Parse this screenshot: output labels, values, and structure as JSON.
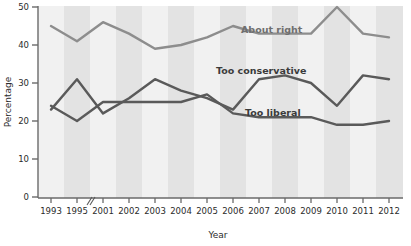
{
  "chart_data": {
    "type": "line",
    "title": "",
    "xlabel": "Year",
    "ylabel": "Percentage",
    "ylim": [
      0,
      50
    ],
    "yticks": [
      0,
      10,
      20,
      30,
      40,
      50
    ],
    "grid": false,
    "axis_break": "//",
    "axis_break_note": "break in x-axis between 1995 and 2001",
    "legend_position": "inline-labels",
    "categories": [
      "1993",
      "1995",
      "2001",
      "2002",
      "2003",
      "2004",
      "2005",
      "2006",
      "2007",
      "2008",
      "2009",
      "2010",
      "2011",
      "2012"
    ],
    "series": [
      {
        "name": "About right",
        "color": "#8d8d8d",
        "values": [
          45,
          41,
          46,
          43,
          39,
          40,
          42,
          45,
          43,
          43,
          43,
          50,
          43,
          42
        ]
      },
      {
        "name": "Too conservative",
        "color": "#5a5a5a",
        "values": [
          24,
          20,
          25,
          25,
          25,
          25,
          27,
          22,
          21,
          21,
          21,
          19,
          19,
          20
        ]
      },
      {
        "name": "Too liberal",
        "color": "#5a5a5a",
        "values": [
          23,
          31,
          22,
          26,
          31,
          28,
          26,
          23,
          31,
          32,
          30,
          24,
          32,
          31
        ]
      }
    ]
  },
  "axes": {
    "y_title": "Percentage",
    "x_title": "Year",
    "y_tick_labels": [
      "0",
      "10",
      "20",
      "30",
      "40",
      "50"
    ],
    "x_tick_labels": [
      "1993",
      "1995",
      "2001",
      "2002",
      "2003",
      "2004",
      "2005",
      "2006",
      "2007",
      "2008",
      "2009",
      "2010",
      "2011",
      "2012"
    ],
    "break_marker": "//"
  },
  "annotations": {
    "about_right": "About right",
    "too_conservative": "Too conservative",
    "too_liberal": "Too liberal"
  },
  "colors": {
    "about_right_line": "#8d8d8d",
    "dark_line": "#5a5a5a",
    "band_light": "#f0f0f0",
    "band_dark": "#e2e2e2",
    "axis": "#6a6a6a",
    "text": "#2b2b2b"
  }
}
